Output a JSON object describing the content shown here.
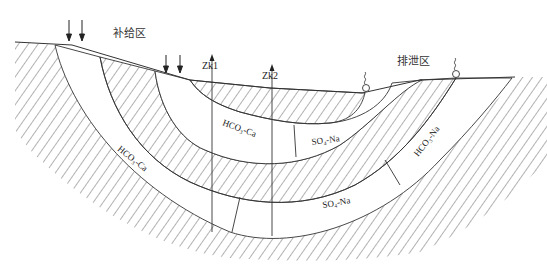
{
  "diagram": {
    "title": "",
    "zones": {
      "recharge": "补给区",
      "discharge": "排泄区"
    },
    "boreholes": [
      {
        "id": "zk1",
        "label": "Zk1"
      },
      {
        "id": "zk2",
        "label": "Zk2"
      }
    ],
    "water_types": [
      {
        "id": "outer-left",
        "label": "HCO3-Ca",
        "display": "HCO₃-Ca"
      },
      {
        "id": "middle-left",
        "label": "HCO3-Ca",
        "display": "HCO₃-Ca"
      },
      {
        "id": "inner-right",
        "label": "SO4-Na",
        "display": "SO₄-Na"
      },
      {
        "id": "outer-bottom",
        "label": "SO4-Na",
        "display": "SO₄-Na"
      },
      {
        "id": "outer-right",
        "label": "HCO3-Na",
        "display": "HCO₃-Na"
      }
    ],
    "legend": {
      "hatched": "aquitard / low-permeability layer",
      "blank": "aquifer flow band"
    },
    "colors": {
      "line": "#333333",
      "hatch": "#555555",
      "background": "#ffffff"
    }
  }
}
